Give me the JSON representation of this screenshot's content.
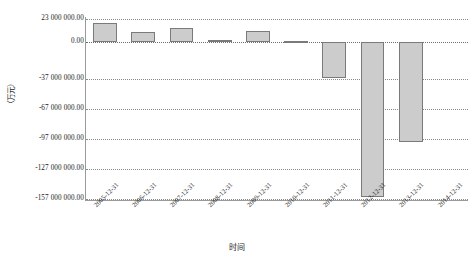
{
  "chart_data": {
    "type": "bar",
    "title": "",
    "xlabel": "时间",
    "ylabel": "（万元）",
    "categories": [
      "2005-12-31",
      "2006-12-31",
      "2007-12-31",
      "2008-12-31",
      "2009-12-31",
      "2010-12-31",
      "2011-12-31",
      "2012-12-31",
      "2013-12-31",
      "2014-12-31"
    ],
    "values": [
      19000000.0,
      10000000.0,
      14000000.0,
      2000000.0,
      11000000.0,
      1500000.0,
      -36000000.0,
      -155000000.0,
      -100000000.0,
      0
    ],
    "ylim": [
      -157000000.0,
      23000000.0
    ],
    "yticks": [
      23000000.0,
      0.0,
      -37000000.0,
      -67000000.0,
      -97000000.0,
      -127000000.0,
      -157000000.0
    ],
    "ytick_labels": [
      "23 000 000.00",
      "0.00",
      "-37 000 000.00",
      "-67 000 000.00",
      "-97 000 000.00",
      "-127 000 000.00",
      "-157 000 000.00"
    ],
    "grid": true,
    "legend": false,
    "bar_color": "#cccccc",
    "bar_border_color": "#7a7a7a",
    "grid_color": "#8c8c8c",
    "axis_color": "#9a9a9a"
  }
}
